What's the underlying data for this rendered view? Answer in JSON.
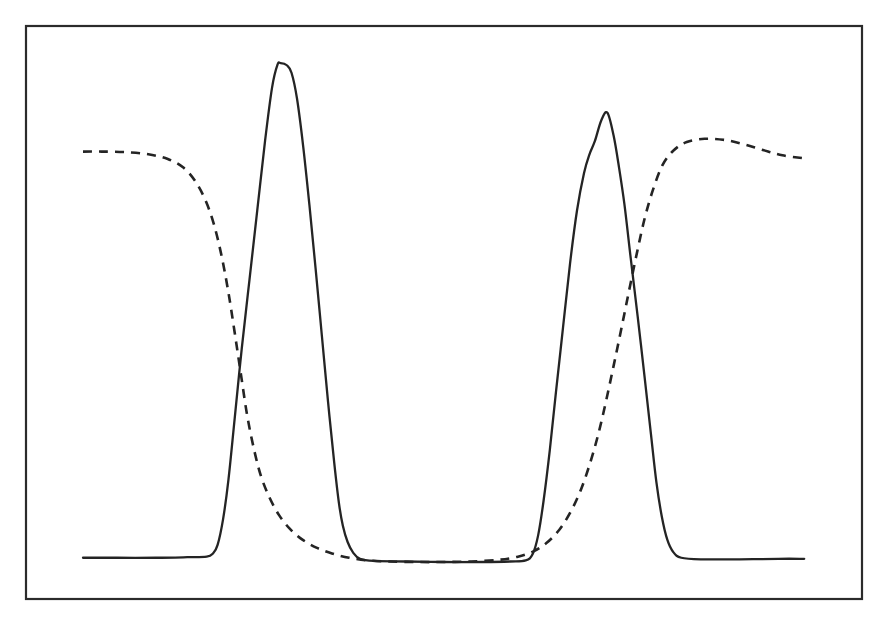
{
  "figure": {
    "background_color": "#ffffff",
    "frame_color": "#2b2b2b",
    "line_color": "#242424",
    "frame": {
      "x": 25,
      "y": 25,
      "width": 838,
      "height": 575
    }
  },
  "chart_data": {
    "type": "line",
    "title": "",
    "subtitle": "",
    "xlabel": "",
    "ylabel": "",
    "xlim": [
      0,
      100
    ],
    "ylim": [
      0,
      1
    ],
    "grid": false,
    "legend": false,
    "legend_position": "none",
    "axis_ticks": false,
    "tick_labels": {
      "x": [],
      "y": []
    },
    "annotations": [],
    "series": [
      {
        "name": "solid-curve",
        "style": "solid",
        "color": "#242424",
        "description": "Flat low baseline with two tall narrow peaks; first peak has a small flat plateau top, second peak is a sharp apex with a slight shoulder on its right flank.",
        "features": {
          "baseline_level": 0.035,
          "peak_count": 2,
          "peak1": {
            "x": 29.0,
            "y": 0.965,
            "shape": "flat-top plateau"
          },
          "peak2": {
            "x": 71.0,
            "y": 0.87,
            "shape": "sharp apex"
          },
          "trough": {
            "x_range": [
              39,
              61
            ],
            "y": 0.03
          }
        },
        "points": [
          [
            3.6,
            0.038
          ],
          [
            8.0,
            0.038
          ],
          [
            13.0,
            0.038
          ],
          [
            17.0,
            0.039
          ],
          [
            19.5,
            0.04
          ],
          [
            20.3,
            0.046
          ],
          [
            20.9,
            0.062
          ],
          [
            21.6,
            0.11
          ],
          [
            22.3,
            0.185
          ],
          [
            23.1,
            0.3
          ],
          [
            24.0,
            0.43
          ],
          [
            25.0,
            0.56
          ],
          [
            26.0,
            0.69
          ],
          [
            27.0,
            0.82
          ],
          [
            27.9,
            0.92
          ],
          [
            28.6,
            0.963
          ],
          [
            29.0,
            0.966
          ],
          [
            29.8,
            0.962
          ],
          [
            30.4,
            0.948
          ],
          [
            31.1,
            0.9
          ],
          [
            31.9,
            0.81
          ],
          [
            32.7,
            0.7
          ],
          [
            33.5,
            0.58
          ],
          [
            34.3,
            0.455
          ],
          [
            35.1,
            0.33
          ],
          [
            35.9,
            0.215
          ],
          [
            36.5,
            0.14
          ],
          [
            37.0,
            0.098
          ],
          [
            37.6,
            0.068
          ],
          [
            38.3,
            0.048
          ],
          [
            39.2,
            0.036
          ],
          [
            41.0,
            0.032
          ],
          [
            45.0,
            0.031
          ],
          [
            50.0,
            0.03
          ],
          [
            55.0,
            0.03
          ],
          [
            58.5,
            0.031
          ],
          [
            60.5,
            0.033
          ],
          [
            61.4,
            0.045
          ],
          [
            62.1,
            0.08
          ],
          [
            62.8,
            0.145
          ],
          [
            63.6,
            0.24
          ],
          [
            64.4,
            0.35
          ],
          [
            65.3,
            0.47
          ],
          [
            66.2,
            0.59
          ],
          [
            67.1,
            0.69
          ],
          [
            68.0,
            0.76
          ],
          [
            68.7,
            0.795
          ],
          [
            69.4,
            0.82
          ],
          [
            70.2,
            0.858
          ],
          [
            71.0,
            0.873
          ],
          [
            71.8,
            0.83
          ],
          [
            72.5,
            0.77
          ],
          [
            73.2,
            0.7
          ],
          [
            74.0,
            0.6
          ],
          [
            74.9,
            0.49
          ],
          [
            75.8,
            0.375
          ],
          [
            76.6,
            0.27
          ],
          [
            77.3,
            0.18
          ],
          [
            78.0,
            0.115
          ],
          [
            78.7,
            0.072
          ],
          [
            79.5,
            0.048
          ],
          [
            80.5,
            0.038
          ],
          [
            83.0,
            0.035
          ],
          [
            88.0,
            0.035
          ],
          [
            93.0,
            0.036
          ],
          [
            96.3,
            0.036
          ]
        ]
      },
      {
        "name": "dashed-curve",
        "style": "dashed",
        "color": "#242424",
        "description": "Starts high on the left, falls through a sigmoid inflection to a low flat middle, then rises back to a high plateau on the right with a slight roll-off at the far edge.",
        "features": {
          "left_plateau_level": 0.8,
          "right_plateau_level": 0.815,
          "minimum_level": 0.03,
          "inflection_down_x": 22.5,
          "inflection_up_x": 70.5,
          "crossings_with_solid": [
            {
              "x": 24.7,
              "y": 0.258
            },
            {
              "x": 76.4,
              "y": 0.3
            }
          ]
        },
        "points": [
          [
            3.6,
            0.8
          ],
          [
            6.0,
            0.8
          ],
          [
            9.0,
            0.799
          ],
          [
            12.0,
            0.795
          ],
          [
            14.5,
            0.786
          ],
          [
            16.5,
            0.77
          ],
          [
            18.0,
            0.745
          ],
          [
            19.3,
            0.71
          ],
          [
            20.4,
            0.665
          ],
          [
            21.4,
            0.605
          ],
          [
            22.3,
            0.535
          ],
          [
            23.1,
            0.46
          ],
          [
            23.9,
            0.382
          ],
          [
            24.7,
            0.305
          ],
          [
            25.6,
            0.24
          ],
          [
            26.5,
            0.19
          ],
          [
            27.6,
            0.15
          ],
          [
            28.8,
            0.118
          ],
          [
            30.2,
            0.092
          ],
          [
            31.8,
            0.072
          ],
          [
            33.6,
            0.057
          ],
          [
            35.6,
            0.046
          ],
          [
            37.8,
            0.038
          ],
          [
            40.2,
            0.033
          ],
          [
            43.0,
            0.031
          ],
          [
            46.5,
            0.03
          ],
          [
            50.0,
            0.03
          ],
          [
            53.5,
            0.031
          ],
          [
            57.0,
            0.034
          ],
          [
            59.5,
            0.04
          ],
          [
            61.5,
            0.05
          ],
          [
            63.2,
            0.066
          ],
          [
            64.8,
            0.09
          ],
          [
            66.2,
            0.122
          ],
          [
            67.5,
            0.162
          ],
          [
            68.7,
            0.212
          ],
          [
            69.8,
            0.268
          ],
          [
            70.8,
            0.33
          ],
          [
            71.8,
            0.398
          ],
          [
            72.8,
            0.468
          ],
          [
            73.8,
            0.54
          ],
          [
            74.8,
            0.61
          ],
          [
            75.8,
            0.675
          ],
          [
            76.9,
            0.73
          ],
          [
            78.1,
            0.775
          ],
          [
            79.5,
            0.802
          ],
          [
            81.2,
            0.818
          ],
          [
            83.5,
            0.824
          ],
          [
            86.0,
            0.822
          ],
          [
            88.5,
            0.814
          ],
          [
            91.0,
            0.803
          ],
          [
            93.5,
            0.793
          ],
          [
            96.5,
            0.787
          ]
        ]
      }
    ]
  }
}
